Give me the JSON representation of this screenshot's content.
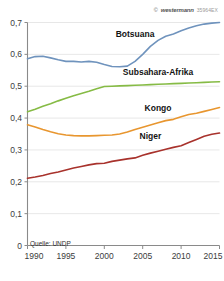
{
  "credit": {
    "copyright_mark": "©",
    "brand": "westermann",
    "code": "35964EX"
  },
  "source": "Quelle: UNDP",
  "chart_data": {
    "type": "line",
    "title": "",
    "xlabel": "",
    "ylabel": "",
    "xlim": [
      1990,
      2015
    ],
    "ylim": [
      0,
      0.7
    ],
    "grid": true,
    "legend_position": "inline-labels",
    "x_ticks": [
      1990,
      1995,
      2000,
      2005,
      2010,
      2015
    ],
    "x_tick_labels": [
      "1990",
      "1995",
      "2000",
      "2005",
      "2010",
      "2015"
    ],
    "y_ticks": [
      0,
      0.1,
      0.2,
      0.3,
      0.4,
      0.5,
      0.6,
      0.7
    ],
    "y_tick_labels": [
      "0",
      "0,1",
      "0,2",
      "0,3",
      "0,4",
      "0,5",
      "0,6",
      "0,7"
    ],
    "x": [
      1990,
      1991,
      1992,
      1993,
      1994,
      1995,
      1996,
      1997,
      1998,
      1999,
      2000,
      2001,
      2002,
      2003,
      2004,
      2005,
      2006,
      2007,
      2008,
      2009,
      2010,
      2011,
      2012,
      2013,
      2014,
      2015
    ],
    "series": [
      {
        "name": "Botsuana",
        "color": "#6f93bd",
        "label_x": 2004,
        "label_y": 0.655,
        "values": [
          0.586,
          0.593,
          0.594,
          0.589,
          0.583,
          0.578,
          0.578,
          0.576,
          0.578,
          0.575,
          0.568,
          0.562,
          0.561,
          0.563,
          0.578,
          0.6,
          0.625,
          0.644,
          0.657,
          0.664,
          0.674,
          0.683,
          0.69,
          0.695,
          0.698,
          0.7
        ]
      },
      {
        "name": "Subsahara-Afrika",
        "color": "#86bb45",
        "label_x": 2007,
        "label_y": 0.535,
        "values": [
          0.42,
          0.428,
          0.437,
          0.445,
          0.454,
          0.462,
          0.47,
          0.477,
          0.484,
          0.492,
          0.499,
          0.5,
          0.501,
          0.502,
          0.503,
          0.504,
          0.505,
          0.506,
          0.507,
          0.508,
          0.509,
          0.51,
          0.511,
          0.512,
          0.513,
          0.514
        ]
      },
      {
        "name": "Kongo",
        "color": "#e8962f",
        "label_x": 2007,
        "label_y": 0.422,
        "values": [
          0.379,
          0.372,
          0.364,
          0.357,
          0.351,
          0.347,
          0.345,
          0.344,
          0.344,
          0.345,
          0.346,
          0.347,
          0.35,
          0.356,
          0.364,
          0.371,
          0.378,
          0.385,
          0.392,
          0.396,
          0.404,
          0.411,
          0.415,
          0.421,
          0.427,
          0.433
        ]
      },
      {
        "name": "Niger",
        "color": "#a8322c",
        "label_x": 2006,
        "label_y": 0.333,
        "values": [
          0.211,
          0.215,
          0.22,
          0.226,
          0.231,
          0.237,
          0.243,
          0.248,
          0.253,
          0.257,
          0.258,
          0.264,
          0.268,
          0.272,
          0.275,
          0.283,
          0.29,
          0.296,
          0.302,
          0.308,
          0.313,
          0.323,
          0.333,
          0.343,
          0.349,
          0.353
        ]
      }
    ]
  }
}
